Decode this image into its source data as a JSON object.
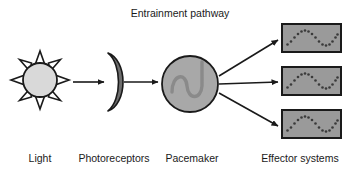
{
  "figure": {
    "title": "Entrainment pathway",
    "background_color": "#ffffff",
    "stroke_color": "#1a1a1a",
    "text_color": "#1a1a1a"
  },
  "colors": {
    "sun_fill": "#d9d9d9",
    "sun_ray_fill": "#ffffff",
    "photoreceptor_fill": "#6e6e6e",
    "pacemaker_fill": "#a8a8a8",
    "pacemaker_wave": "#8a8a8a",
    "effector_fill": "#9a9a9a",
    "effector_dot": "#3a3a3a",
    "outline": "#1a1a1a"
  },
  "nodes": {
    "light": {
      "label": "Light",
      "icon": "sun-icon",
      "center_x": 40,
      "center_y": 80,
      "radius": 17,
      "ray_count": 8,
      "ray_outer_radius": 29
    },
    "photoreceptors": {
      "label": "Photoreceptors",
      "icon": "crescent-lens-icon",
      "center_x": 114,
      "center_y": 82
    },
    "pacemaker": {
      "label": "Pacemaker",
      "icon": "oscillator-circle-icon",
      "center_x": 190,
      "center_y": 84,
      "radius": 28
    },
    "effectors": {
      "label": "Effector systems",
      "icon": "waveform-box-icon",
      "boxes": [
        {
          "x": 282,
          "y": 24,
          "width": 59,
          "height": 28
        },
        {
          "x": 282,
          "y": 67,
          "width": 59,
          "height": 28
        },
        {
          "x": 282,
          "y": 110,
          "width": 59,
          "height": 28
        }
      ],
      "dots_per_wave": 17
    }
  },
  "arrows": [
    {
      "name": "light-to-photoreceptors",
      "x1": 73,
      "y1": 82,
      "x2": 104,
      "y2": 82
    },
    {
      "name": "photoreceptors-to-pacemaker",
      "x1": 124,
      "y1": 82,
      "x2": 158,
      "y2": 82
    },
    {
      "name": "pacemaker-to-effector-1",
      "x1": 219,
      "y1": 76,
      "x2": 278,
      "y2": 40
    },
    {
      "name": "pacemaker-to-effector-2",
      "x1": 219,
      "y1": 84,
      "x2": 278,
      "y2": 82
    },
    {
      "name": "pacemaker-to-effector-3",
      "x1": 219,
      "y1": 93,
      "x2": 278,
      "y2": 126
    }
  ],
  "labels": {
    "light": {
      "text": "Light",
      "x": 40,
      "y": 162
    },
    "photoreceptors": {
      "text": "Photoreceptors",
      "x": 114,
      "y": 162
    },
    "pacemaker": {
      "text": "Pacemaker",
      "x": 192,
      "y": 162
    },
    "effectors": {
      "text": "Effector systems",
      "x": 300,
      "y": 162
    },
    "title": {
      "text": "Entrainment pathway",
      "x": 180,
      "y": 17
    }
  }
}
